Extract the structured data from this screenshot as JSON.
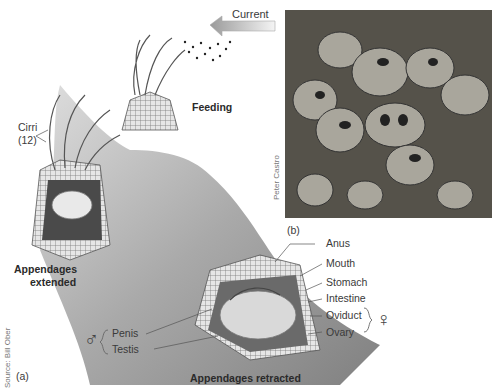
{
  "figure": {
    "panel_a": {
      "label": "(a)",
      "source_credit": "Source: Bill Ober",
      "current_label": "Current",
      "feeding_label": "Feeding",
      "cirri_label": "Cirri",
      "cirri_count": "(12)",
      "extended_caption_line1": "Appendages",
      "extended_caption_line2": "extended",
      "retracted_caption": "Appendages retracted",
      "organ_labels": {
        "right": [
          "Anus",
          "Mouth",
          "Stomach",
          "Intestine",
          "Oviduct",
          "Ovary"
        ],
        "left": [
          "Penis",
          "Testis"
        ]
      },
      "male_symbol": "♂",
      "female_symbol": "♀"
    },
    "panel_b": {
      "label": "(b)",
      "photo_credit": "Peter Castro",
      "photo_subject": "barnacles-on-rock-photo"
    }
  }
}
